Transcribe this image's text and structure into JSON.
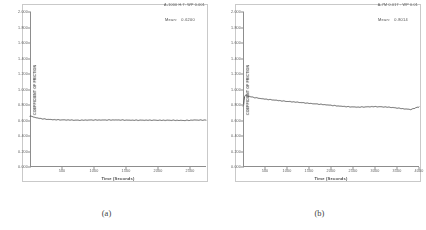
{
  "figure": {
    "caption_a": "(a)",
    "caption_b": "(b)"
  },
  "panels": [
    {
      "id": "a",
      "header": "A-1000 H.7:  WP 0.001",
      "mean_key": "Mean:",
      "mean_value": "0.6200",
      "caption": "(a)"
    },
    {
      "id": "b",
      "header": "A-7M 0.017 : WP 0.01",
      "mean_key": "Mean:",
      "mean_value": "0.8014",
      "caption": "(b)"
    }
  ],
  "chart_data": [
    {
      "type": "line",
      "title": "A-1000 H.7:  WP 0.001",
      "xlabel": "Time (Seconds)",
      "ylabel": "COEFFICIENT OF FRICTION",
      "xlim": [
        0,
        2750
      ],
      "ylim": [
        0.0,
        2.0
      ],
      "xticks": [
        500,
        1000,
        1500,
        2000,
        2500
      ],
      "yticks": [
        "0.000",
        "0.200",
        "0.400",
        "0.600",
        "0.800",
        "1.000",
        "1.200",
        "1.400",
        "1.600",
        "1.800",
        "2.000"
      ],
      "grid": false,
      "legend": "none",
      "annotations": [
        {
          "label": "Mean:",
          "value": "0.6200"
        }
      ],
      "series": [
        {
          "name": "coefficient-of-friction",
          "x": [
            20,
            45,
            70,
            100,
            140,
            190,
            250,
            320,
            400,
            500,
            620,
            760,
            900,
            1050,
            1200,
            1350,
            1500,
            1650,
            1800,
            1950,
            2100,
            2250,
            2400,
            2500,
            2580,
            2650,
            2700
          ],
          "y": [
            0.655,
            0.648,
            0.641,
            0.634,
            0.628,
            0.622,
            0.617,
            0.613,
            0.61,
            0.607,
            0.606,
            0.604,
            0.605,
            0.606,
            0.607,
            0.606,
            0.605,
            0.604,
            0.603,
            0.604,
            0.603,
            0.602,
            0.601,
            0.603,
            0.606,
            0.604,
            0.605
          ]
        }
      ]
    },
    {
      "type": "line",
      "title": "A-7M 0.017 : WP 0.01",
      "xlabel": "Time (Seconds)",
      "ylabel": "COEFFICIENT OF FRICTION",
      "xlim": [
        0,
        4000
      ],
      "ylim": [
        0.0,
        2.0
      ],
      "xticks": [
        500,
        1000,
        1500,
        2000,
        2500,
        3000,
        3500,
        4000
      ],
      "yticks": [
        "0.000",
        "0.200",
        "0.400",
        "0.600",
        "0.800",
        "1.000",
        "1.200",
        "1.400",
        "1.600",
        "1.800",
        "2.000"
      ],
      "grid": false,
      "legend": "none",
      "annotations": [
        {
          "label": "Mean:",
          "value": "0.8014"
        }
      ],
      "series": [
        {
          "name": "coefficient-of-friction",
          "x": [
            15,
            30,
            55,
            90,
            140,
            200,
            280,
            380,
            500,
            640,
            800,
            980,
            1160,
            1340,
            1520,
            1700,
            1880,
            2060,
            2240,
            2420,
            2600,
            2780,
            2960,
            3140,
            3320,
            3500,
            3680,
            3820,
            3900,
            3960
          ],
          "y": [
            0.79,
            0.9,
            0.928,
            0.922,
            0.912,
            0.903,
            0.895,
            0.886,
            0.876,
            0.867,
            0.858,
            0.848,
            0.839,
            0.83,
            0.821,
            0.812,
            0.802,
            0.793,
            0.784,
            0.776,
            0.772,
            0.776,
            0.779,
            0.776,
            0.772,
            0.762,
            0.748,
            0.742,
            0.758,
            0.772
          ]
        }
      ]
    }
  ]
}
